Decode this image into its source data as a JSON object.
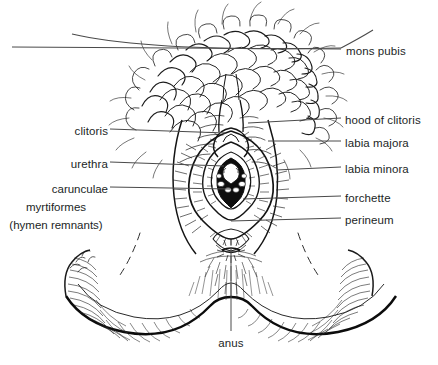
{
  "figure": {
    "style": "pen-and-ink line drawing",
    "background_color": "#ffffff",
    "ink_color": "#1a1a1a",
    "leader_color": "#555555",
    "text_color": "#221f1f"
  },
  "labels": {
    "mons_pubis": "mons pubis",
    "hood_of_clitoris": "hood of clitoris",
    "labia_majora": "labia majora",
    "labia_minora": "labia minora",
    "forchette": "forchette",
    "perineum": "perineum",
    "clitoris": "clitoris",
    "urethra": "urethra",
    "carunculae": "carunculae",
    "myrtiformes": "myrtiformes",
    "hymen_remnants": "(hymen remnants)",
    "anus": "anus"
  },
  "callouts": [
    {
      "id": "mons-pubis",
      "text": "mons pubis",
      "side": "right",
      "x": 346,
      "y": 51
    },
    {
      "id": "hood-of-clitoris",
      "text": "hood of clitoris",
      "side": "right",
      "x": 345,
      "y": 121
    },
    {
      "id": "labia-majora",
      "text": "labia majora",
      "side": "right",
      "x": 345,
      "y": 144
    },
    {
      "id": "labia-minora",
      "text": "labia minora",
      "side": "right",
      "x": 345,
      "y": 170
    },
    {
      "id": "forchette",
      "text": "forchette",
      "side": "right",
      "x": 345,
      "y": 199
    },
    {
      "id": "perineum",
      "text": "perineum",
      "side": "right",
      "x": 345,
      "y": 221
    },
    {
      "id": "clitoris",
      "text": "clitoris",
      "side": "left",
      "x": 104,
      "y": 132
    },
    {
      "id": "urethra",
      "text": "urethra",
      "side": "left",
      "x": 104,
      "y": 165
    },
    {
      "id": "carunculae-myrtiformes",
      "text": "carunculae",
      "side": "left",
      "x": 104,
      "y": 190
    },
    {
      "id": "anus",
      "text": "anus",
      "side": "bottom",
      "x": 231,
      "y": 345
    }
  ]
}
